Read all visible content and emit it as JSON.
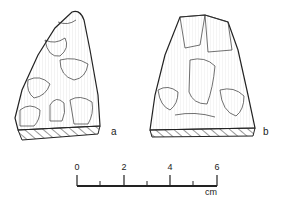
{
  "figure": {
    "artifacts": [
      {
        "id": "a",
        "label": "a"
      },
      {
        "id": "b",
        "label": "b"
      }
    ],
    "scale_bar": {
      "ticks": [
        "0",
        "2",
        "4",
        "6"
      ],
      "unit": "cm"
    }
  }
}
